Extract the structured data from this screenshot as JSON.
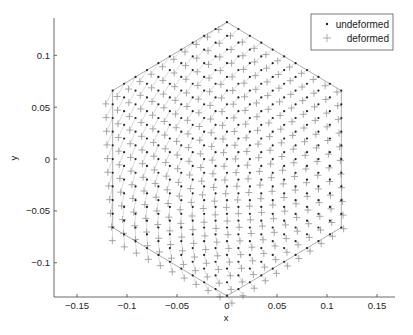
{
  "chart_data": {
    "type": "scatter",
    "title": "",
    "xlabel": "x",
    "ylabel": "y",
    "xlim": [
      -0.173,
      0.168
    ],
    "ylim": [
      -0.133,
      0.136
    ],
    "xticks": [
      -0.15,
      -0.1,
      -0.05,
      0,
      0.05,
      0.1,
      0.15
    ],
    "xtick_labels": [
      "-0.15",
      "-0.1",
      "-0.05",
      "0",
      "0.05",
      "0.1",
      "0.15"
    ],
    "yticks": [
      -0.1,
      -0.05,
      0,
      0.05,
      0.1
    ],
    "ytick_labels": [
      "-0.1",
      "-0.05",
      "0",
      "0.05",
      "0.1"
    ],
    "grid": false,
    "legend_position": "upper right",
    "legend": [
      {
        "label": "undeformed",
        "marker": "dot",
        "color": "#222222"
      },
      {
        "label": "deformed",
        "marker": "plus",
        "color": "#888888"
      }
    ],
    "mesh": {
      "shape": "regular hexagon",
      "circumradius": 0.132,
      "vertices": [
        [
          0,
          0.132
        ],
        [
          0.114,
          0.066
        ],
        [
          0.114,
          -0.066
        ],
        [
          0,
          -0.132
        ],
        [
          -0.114,
          -0.066
        ],
        [
          -0.114,
          0.066
        ]
      ],
      "subdivisions_per_edge": 10,
      "lattice": "triangular",
      "edge_color": "#888888"
    },
    "series": [
      {
        "name": "undeformed",
        "description": "triangular lattice nodes filling the hexagon (10 divisions per edge, 331 nodes)"
      },
      {
        "name": "deformed",
        "description": "same nodes displaced by a smooth twist-like field: roughly (-0.008, +0.004) near top/left, (-0.003, +0.004) at center, near zero at right edge"
      }
    ],
    "deformation_model": {
      "rotation_center": [
        0.14,
        -0.02
      ],
      "rotation_angle_rad": 0.05,
      "bend_coeff": 0.35
    }
  },
  "axes": {
    "x_label": "x",
    "y_label": "y"
  },
  "legend": {
    "items": [
      {
        "label": "undeformed"
      },
      {
        "label": "deformed"
      }
    ]
  }
}
